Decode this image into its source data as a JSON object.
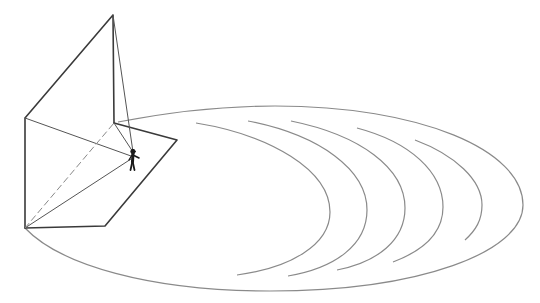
{
  "diagram": {
    "colors": {
      "background": "#ffffff",
      "structure_stroke": "#3a3a3a",
      "thin_stroke": "#555555",
      "ellipse_stroke": "#8a8a8a",
      "arc_stroke": "#8a8a8a",
      "figure_fill": "#1a1a1a"
    },
    "structure": {
      "apex": [
        113,
        15
      ],
      "left_top": [
        25,
        118
      ],
      "left_bottom": [
        25,
        228
      ],
      "inner_corner": [
        114,
        123
      ],
      "floor_right": [
        177,
        140
      ],
      "floor_bottom": [
        105,
        226
      ],
      "figure_head": [
        133,
        152
      ]
    },
    "ellipse": {
      "start": [
        118,
        122
      ],
      "top": [
        260,
        107
      ],
      "right": [
        523,
        205
      ],
      "bottom": [
        270,
        290
      ],
      "end": [
        25,
        228
      ]
    },
    "arcs": [
      {
        "start": [
          196,
          123
        ],
        "extreme": [
          330,
          210
        ],
        "end": [
          237,
          275
        ]
      },
      {
        "start": [
          248,
          121
        ],
        "extreme": [
          367,
          210
        ],
        "end": [
          288,
          276
        ]
      },
      {
        "start": [
          291,
          121
        ],
        "extreme": [
          405,
          208
        ],
        "end": [
          337,
          270
        ]
      },
      {
        "start": [
          357,
          128
        ],
        "extreme": [
          443,
          207
        ],
        "end": [
          393,
          262
        ]
      },
      {
        "start": [
          415,
          140
        ],
        "extreme": [
          482,
          205
        ],
        "end": [
          465,
          240
        ]
      }
    ],
    "figure": {
      "label": "standing-person"
    }
  }
}
